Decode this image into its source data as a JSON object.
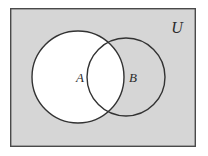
{
  "figure": {
    "kind": "venn-diagram",
    "caption": "",
    "universe": {
      "label": "U",
      "fill_color": "#d6d6d6",
      "border_color": "#4a4a4a",
      "border_width": 1.4,
      "rect": {
        "x": 10,
        "y": 8,
        "width": 186,
        "height": 139
      },
      "label_position": {
        "x": 177,
        "y": 27
      }
    },
    "sets": [
      {
        "label": "A",
        "shape": "circle",
        "center": {
          "x": 78,
          "y": 77
        },
        "radius": 46,
        "fill_color": "#ffffff",
        "filled": true,
        "stroke_color": "#333333",
        "stroke_width": 1.4,
        "label_position": {
          "x": 80,
          "y": 77
        }
      },
      {
        "label": "B",
        "shape": "circle",
        "center": {
          "x": 126,
          "y": 77
        },
        "radius": 39,
        "fill_color": "none",
        "filled": false,
        "stroke_color": "#333333",
        "stroke_width": 1.4,
        "label_position": {
          "x": 133,
          "y": 77
        }
      }
    ],
    "shaded_region": {
      "description": "A",
      "color": "#ffffff"
    },
    "background_color": "#ffffff"
  }
}
